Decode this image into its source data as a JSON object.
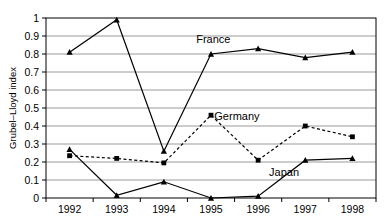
{
  "chart_data": {
    "type": "line",
    "title": "",
    "xlabel": "",
    "ylabel": "Grubel–Lloyd index",
    "categories": [
      "1992",
      "1993",
      "1994",
      "1995",
      "1996",
      "1997",
      "1998"
    ],
    "ylim": [
      0,
      1
    ],
    "ytick_labels": [
      "0",
      "0.1",
      "0.2",
      "0.3",
      "0.4",
      "0.5",
      "0.6",
      "0.7",
      "0.8",
      "0.9",
      "1"
    ],
    "ytick_values": [
      0,
      0.1,
      0.2,
      0.3,
      0.4,
      0.5,
      0.6,
      0.7,
      0.8,
      0.9,
      1
    ],
    "grid": true,
    "legend_position": "inline-annotations",
    "series": [
      {
        "name": "France",
        "values": [
          0.81,
          0.99,
          0.26,
          0.8,
          0.83,
          0.78,
          0.81
        ],
        "line_style": "solid",
        "marker": "triangle",
        "color": "#000000",
        "label": "France",
        "label_x": 1995.05,
        "label_y": 0.885
      },
      {
        "name": "Germany",
        "values": [
          0.235,
          0.22,
          0.195,
          0.46,
          0.21,
          0.4,
          0.34
        ],
        "line_style": "dashed",
        "marker": "square",
        "color": "#000000",
        "label": "Germany",
        "label_x": 1995.55,
        "label_y": 0.455
      },
      {
        "name": "Japan",
        "values": [
          0.27,
          0.015,
          0.09,
          0.0,
          0.01,
          0.21,
          0.22
        ],
        "line_style": "solid",
        "marker": "triangle",
        "color": "#000000",
        "label": "Japan",
        "label_x": 1996.55,
        "label_y": 0.145
      }
    ]
  },
  "axis": {
    "y_title": "Grubel–Lloyd index"
  },
  "footer": {
    "source_note": ""
  }
}
